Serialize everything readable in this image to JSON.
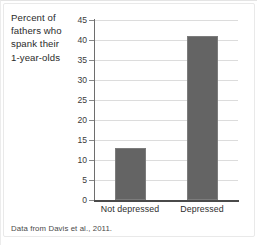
{
  "chart_data": {
    "type": "bar",
    "title": "",
    "xlabel": "",
    "ylabel": "Percent of fathers who spank their 1-year-olds",
    "categories": [
      "Not depressed",
      "Depressed"
    ],
    "values": [
      13,
      41
    ],
    "ylim": [
      0,
      45
    ],
    "yticks": [
      0,
      5,
      10,
      15,
      20,
      25,
      30,
      35,
      40,
      45
    ],
    "ytick_labels": [
      "0",
      "5",
      "10",
      "15",
      "20",
      "25",
      "30",
      "35",
      "40",
      "45"
    ],
    "grid": true,
    "legend": "none",
    "bar_color": "#646464",
    "gridline_color": "#dcdcdc",
    "axis_color": "#4a4a4a"
  },
  "axis_title": {
    "line1": "Percent of",
    "line2": "fathers who",
    "line3": "spank their",
    "line4": "1-year-olds"
  },
  "source": {
    "note": "Data from Davis et al., 2011."
  }
}
